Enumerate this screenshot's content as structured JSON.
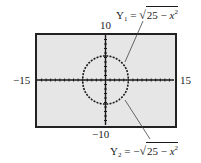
{
  "figure": {
    "window": {
      "xmin_label": "−15",
      "xmax_label": "15",
      "ymax_label": "10",
      "ymin_label": "−10"
    },
    "equations": {
      "y1": {
        "name": "Y",
        "sub": "1",
        "eq": "=",
        "sign": "",
        "radicand_const": "25 − ",
        "var": "x",
        "exp": "2"
      },
      "y2": {
        "name": "Y",
        "sub": "2",
        "eq": "=",
        "sign": "−",
        "radicand_const": "25 − ",
        "var": "x",
        "exp": "2"
      }
    },
    "colors": {
      "screen_bg": "#e6e6e6",
      "curve": "#1a1a1a",
      "leader": "#444444"
    },
    "window_values": {
      "xmin": -15,
      "xmax": 15,
      "ymin": -10,
      "ymax": 10,
      "radius": 5
    }
  }
}
